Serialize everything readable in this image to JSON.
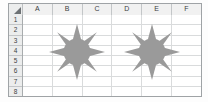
{
  "app": {
    "type": "spreadsheet-grid",
    "background_color": "#ffffff"
  },
  "grid": {
    "select_all_icon": "select-all-triangle-icon",
    "column_headers": [
      "A",
      "B",
      "C",
      "D",
      "E",
      "F"
    ],
    "row_headers": [
      "1",
      "2",
      "3",
      "4",
      "5",
      "6",
      "7",
      "8"
    ],
    "header_fill": "#f1f1f1",
    "header_text_color": "#3c3f41",
    "gridline_color": "#d9dbdc",
    "frame_border_color": "#9fa3a6",
    "cell_fill": "#ffffff"
  },
  "shapes": [
    {
      "name": "sun-shape-left",
      "kind": "sun",
      "ray_count": 8,
      "fill": "#9a9a9a",
      "center_x": 77,
      "center_y": 52,
      "size": 56,
      "anchor_cells": "B2:C7"
    },
    {
      "name": "sun-shape-right",
      "kind": "sun",
      "ray_count": 8,
      "fill": "#9a9a9a",
      "center_x": 152,
      "center_y": 52,
      "size": 56,
      "anchor_cells": "E2:F7"
    }
  ]
}
